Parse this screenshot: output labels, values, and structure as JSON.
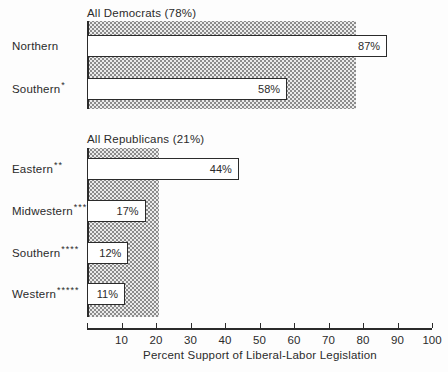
{
  "chart_data": {
    "type": "bar",
    "orientation": "horizontal",
    "xlabel": "Percent Support of Liberal-Labor Legislation",
    "xlim": [
      0,
      100
    ],
    "xticks": [
      10,
      20,
      30,
      40,
      50,
      60,
      70,
      80,
      90,
      100
    ],
    "grid": false,
    "legend": "none",
    "groups": [
      {
        "title": "All Democrats (78%)",
        "share_percent": 78,
        "bars": [
          {
            "label": "Northern",
            "asterisks": "",
            "value": 87,
            "value_label": "87%"
          },
          {
            "label": "Southern",
            "asterisks": "*",
            "value": 58,
            "value_label": "58%"
          }
        ]
      },
      {
        "title": "All Republicans (21%)",
        "share_percent": 21,
        "bars": [
          {
            "label": "Eastern",
            "asterisks": "**",
            "value": 44,
            "value_label": "44%"
          },
          {
            "label": "Midwestern",
            "asterisks": "***",
            "value": 17,
            "value_label": "17%"
          },
          {
            "label": "Southern",
            "asterisks": "****",
            "value": 12,
            "value_label": "12%"
          },
          {
            "label": "Western",
            "asterisks": "*****",
            "value": 11,
            "value_label": "11%"
          }
        ]
      }
    ]
  },
  "colors": {
    "ink": "#2b2b2b",
    "bar_fill": "#ffffff",
    "band_dot": "#8c8c8c",
    "band_bg": "#ebebeb",
    "background": "#fdfdfd"
  }
}
